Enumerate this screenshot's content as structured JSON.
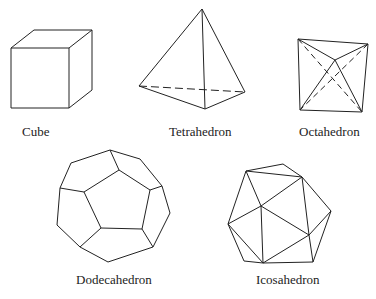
{
  "solids": [
    {
      "name": "Cube",
      "faces": 6
    },
    {
      "name": "Tetrahedron",
      "faces": 4
    },
    {
      "name": "Octahedron",
      "faces": 8
    },
    {
      "name": "Dodecahedron",
      "faces": 12
    },
    {
      "name": "Icosahedron",
      "faces": 20
    }
  ],
  "labels": {
    "cube": "Cube",
    "tetrahedron": "Tetrahedron",
    "octahedron": "Octahedron",
    "dodecahedron": "Dodecahedron",
    "icosahedron": "Icosahedron"
  },
  "colors": {
    "stroke": "#222222",
    "background": "#ffffff"
  }
}
